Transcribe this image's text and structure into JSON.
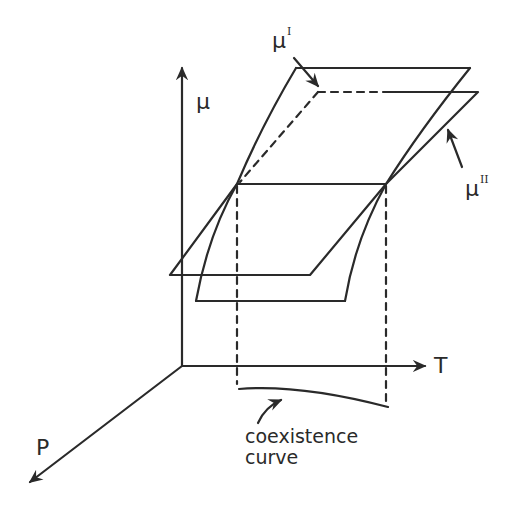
{
  "figure": {
    "type": "3d-thermodynamic-surface-diagram",
    "stroke_color": "#2a2a2a",
    "background": "#ffffff"
  },
  "axes": {
    "mu": {
      "label": "μ"
    },
    "T": {
      "label": "T"
    },
    "P": {
      "label": "P"
    }
  },
  "surfaces": {
    "phase_I": {
      "symbol": "μ",
      "superscript": "I",
      "style": "curved sheet"
    },
    "phase_II": {
      "symbol": "μ",
      "superscript": "II",
      "style": "flat plane"
    }
  },
  "annotations": {
    "coexistence": {
      "line1": "coexistence",
      "line2": "curve"
    }
  }
}
